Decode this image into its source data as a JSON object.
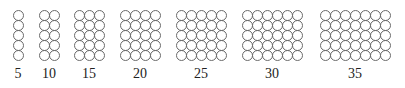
{
  "rows_per_group": 5,
  "groups": [
    {
      "label": "5",
      "count": 5,
      "columns": 1,
      "left": 13
    },
    {
      "label": "10",
      "count": 10,
      "columns": 2,
      "left": 39
    },
    {
      "label": "15",
      "count": 15,
      "columns": 3,
      "left": 74
    },
    {
      "label": "20",
      "count": 20,
      "columns": 4,
      "left": 120
    },
    {
      "label": "25",
      "count": 25,
      "columns": 5,
      "left": 176
    },
    {
      "label": "30",
      "count": 30,
      "columns": 6,
      "left": 242
    },
    {
      "label": "35",
      "count": 35,
      "columns": 7,
      "left": 320
    }
  ],
  "colors": {
    "stroke": "#6a6a6a",
    "text": "#222222",
    "background": "#ffffff"
  }
}
